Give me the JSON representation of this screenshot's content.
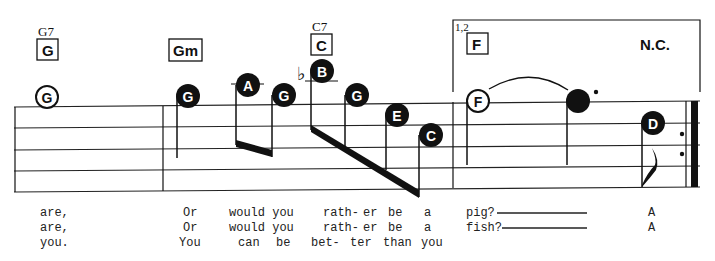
{
  "chords": [
    {
      "id": "c1",
      "alt_label": "G7",
      "label": "G",
      "x": 40,
      "y": 40
    },
    {
      "id": "c2",
      "alt_label": "",
      "label": "Gm",
      "x": 169,
      "y": 40
    },
    {
      "id": "c3",
      "alt_label": "C7",
      "label": "C",
      "x": 311,
      "y": 36
    },
    {
      "id": "c4",
      "alt_label": "",
      "label": "F",
      "x": 466,
      "y": 36
    }
  ],
  "ending": {
    "label": "1,2"
  },
  "no_chord": {
    "label": "N.C."
  },
  "notes": [
    {
      "letter": "G",
      "style": "open",
      "accidental": ""
    },
    {
      "letter": "G",
      "style": "filled",
      "accidental": ""
    },
    {
      "letter": "A",
      "style": "filled",
      "accidental": ""
    },
    {
      "letter": "G",
      "style": "filled",
      "accidental": ""
    },
    {
      "letter": "B",
      "style": "filled",
      "accidental": "♭"
    },
    {
      "letter": "G",
      "style": "filled",
      "accidental": ""
    },
    {
      "letter": "E",
      "style": "filled",
      "accidental": ""
    },
    {
      "letter": "C",
      "style": "filled",
      "accidental": ""
    },
    {
      "letter": "F",
      "style": "open",
      "accidental": ""
    },
    {
      "letter": "",
      "style": "filled-dotted",
      "accidental": ""
    },
    {
      "letter": "D",
      "style": "filled",
      "accidental": ""
    }
  ],
  "lyrics": {
    "verse1": [
      "are,",
      "Or",
      "would you",
      "rath-",
      "er",
      "be",
      "a",
      "pig?",
      "A"
    ],
    "verse2": [
      "are,",
      "Or",
      "would you",
      "rath-",
      "er",
      "be",
      "a",
      "fish?",
      "A"
    ],
    "verse3": [
      "you.",
      "You",
      "can",
      "be",
      "bet-",
      "ter",
      "than",
      "you"
    ]
  }
}
